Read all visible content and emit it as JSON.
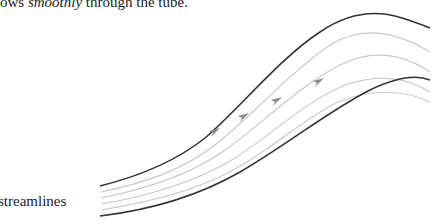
{
  "caption": {
    "prefix": "ows ",
    "emphasis": "smoothly",
    "suffix": " through the tube."
  },
  "diagram": {
    "label": "streamlines",
    "colors": {
      "boundary": "#333333",
      "streamline": "#c8c8c8",
      "arrow": "#8a8a8a"
    },
    "streamline_count": 4,
    "arrow_count": 4
  }
}
